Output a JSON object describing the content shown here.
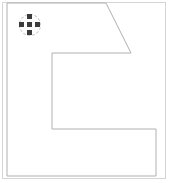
{
  "canvas": {
    "width": 170,
    "height": 183,
    "background_color": "#ffffff",
    "frame": {
      "x": 2,
      "y": 2,
      "width": 164,
      "height": 177,
      "border_color": "#d5d5d5",
      "border_width": 1
    }
  },
  "shape": {
    "name": "C-shaped polygon with chamfered upper-right corner",
    "stroke_color": "#b0b0b0",
    "stroke_width": 1,
    "fill_color": "#ffffff",
    "points": "7,3 106,3 131,53 52,53 52,129 156,129 156,176 7,176",
    "vertices": [
      {
        "label": "top-left",
        "x": 7,
        "y": 3
      },
      {
        "label": "top-chamfer-start",
        "x": 106,
        "y": 3
      },
      {
        "label": "chamfer-end",
        "x": 131,
        "y": 53
      },
      {
        "label": "notch-top-left",
        "x": 52,
        "y": 53
      },
      {
        "label": "notch-bottom-left",
        "x": 52,
        "y": 129
      },
      {
        "label": "notch-bottom-right",
        "x": 156,
        "y": 129
      },
      {
        "label": "bottom-right",
        "x": 156,
        "y": 176
      },
      {
        "label": "bottom-left",
        "x": 7,
        "y": 176
      }
    ]
  },
  "move_handle": {
    "icon": "move-pan-icon",
    "x": 19,
    "y": 14,
    "size": 22,
    "ring_color": "#c9c9c9",
    "nub_color": "#3a3a3a",
    "nub_size": 5,
    "nubs": [
      "center",
      "up",
      "down",
      "left",
      "right"
    ]
  }
}
